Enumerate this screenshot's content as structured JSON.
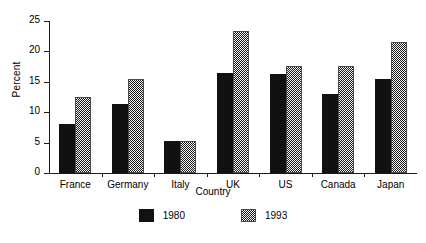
{
  "chart_data": {
    "type": "bar",
    "title": "",
    "xlabel": "Country",
    "ylabel": "Percent",
    "categories": [
      "France",
      "Germany",
      "Italy",
      "UK",
      "US",
      "Canada",
      "Japan"
    ],
    "series": [
      {
        "name": "1980",
        "values": [
          8.0,
          11.3,
          5.3,
          16.4,
          16.3,
          13.0,
          15.5
        ]
      },
      {
        "name": "1993",
        "values": [
          12.5,
          15.4,
          5.2,
          23.4,
          17.6,
          17.6,
          21.5
        ]
      }
    ],
    "ylim": [
      0,
      25
    ],
    "yticks": [
      0,
      5,
      10,
      15,
      20,
      25
    ],
    "ytick_labels": [
      "0",
      "5",
      "10",
      "15",
      "20",
      "25"
    ],
    "grid": false,
    "legend_position": "bottom"
  },
  "legend": {
    "items": [
      {
        "label": "1980",
        "color": "#111111"
      },
      {
        "label": "1993",
        "color": "#808080"
      }
    ]
  }
}
